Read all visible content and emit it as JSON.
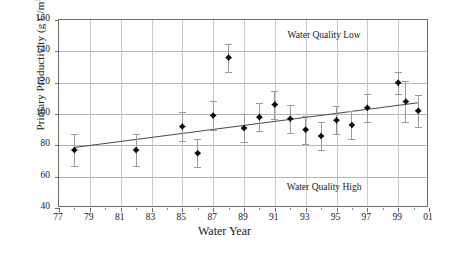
{
  "chart_data": {
    "type": "scatter",
    "title": "",
    "xlabel": "Water Year",
    "ylabel": "Primary Productivity (g C/m",
    "ylabel_sup": "3",
    "ylabel_tail": ")",
    "xlim": [
      77,
      101
    ],
    "ylim": [
      40,
      160
    ],
    "grid": true,
    "legend": "none",
    "yticks": [
      160,
      140,
      120,
      100,
      80,
      60,
      40
    ],
    "xticks": [
      "77",
      "79",
      "81",
      "83",
      "85",
      "87",
      "89",
      "91",
      "93",
      "95",
      "97",
      "99",
      "01"
    ],
    "xtick_values": [
      77,
      79,
      81,
      83,
      85,
      87,
      89,
      91,
      93,
      95,
      97,
      99,
      101
    ],
    "xminor_values": [
      78,
      80,
      82,
      84,
      86,
      88,
      90,
      92,
      94,
      96,
      98,
      100
    ],
    "marker": "filled-diamond",
    "marker_color": "#0a0a0a",
    "errorbar_color": "#9a9a9a",
    "trendline_color": "#4a4a4a",
    "gridline_color": "#b4b4b4",
    "frame_color": "#6d6d6d",
    "points": [
      {
        "x": 78,
        "y": 77,
        "err": 10
      },
      {
        "x": 82,
        "y": 77,
        "err": 10
      },
      {
        "x": 85,
        "y": 92,
        "err": 9
      },
      {
        "x": 86,
        "y": 75,
        "err": 9
      },
      {
        "x": 87,
        "y": 99,
        "err": 9
      },
      {
        "x": 88,
        "y": 136,
        "err": 9
      },
      {
        "x": 89,
        "y": 91,
        "err": 9
      },
      {
        "x": 90,
        "y": 98,
        "err": 9
      },
      {
        "x": 91,
        "y": 106,
        "err": 9
      },
      {
        "x": 92,
        "y": 97,
        "err": 9
      },
      {
        "x": 93,
        "y": 90,
        "err": 9
      },
      {
        "x": 94,
        "y": 86,
        "err": 9
      },
      {
        "x": 95,
        "y": 96,
        "err": 9
      },
      {
        "x": 96,
        "y": 93,
        "err": 9
      },
      {
        "x": 97,
        "y": 104,
        "err": 9
      },
      {
        "x": 99,
        "y": 120,
        "err": 7
      },
      {
        "x": 99.5,
        "y": 108,
        "err": 13
      },
      {
        "x": 100.3,
        "y": 102,
        "err": 10
      }
    ],
    "trendline": {
      "x0": 78,
      "y0": 79,
      "x1": 100.3,
      "y1": 107.5
    },
    "annotations": [
      {
        "text": "Water Quality Low",
        "x": 94.2,
        "y": 150
      },
      {
        "text": "Water Quality High",
        "x": 94.2,
        "y": 53
      }
    ]
  }
}
